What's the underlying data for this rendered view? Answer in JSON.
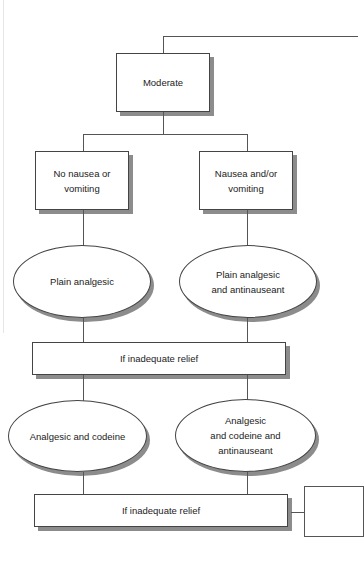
{
  "diagram": {
    "type": "flowchart",
    "root": {
      "label": "Moderate"
    },
    "branches": [
      {
        "label": "No nausea or\nvomiting"
      },
      {
        "label": "Nausea and/or\nvomiting"
      }
    ],
    "step1": [
      {
        "label": "Plain analgesic"
      },
      {
        "label": "Plain analgesic\nand antinauseant"
      }
    ],
    "relief1": {
      "label": "If inadequate relief"
    },
    "step2": [
      {
        "label": "Analgesic and codeine"
      },
      {
        "label": "Analgesic\nand codeine and\nantinauseant"
      }
    ],
    "relief2": {
      "label": "If inadequate relief"
    },
    "colors": {
      "line": "#555555",
      "shadow": "#8c8c8c",
      "fill": "#ffffff"
    }
  }
}
